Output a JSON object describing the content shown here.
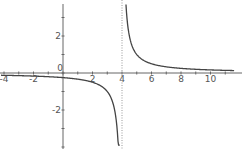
{
  "chart_data": {
    "type": "line",
    "title": "",
    "xlabel": "",
    "ylabel": "",
    "function": "y = 1/(x - 4)",
    "xlim": [
      -4.2,
      11.6
    ],
    "ylim": [
      -4.0,
      4.0
    ],
    "grid": false,
    "legend": null,
    "x_ticks": [
      "-4",
      "-2",
      "0",
      "2",
      "4",
      "6",
      "8",
      "10"
    ],
    "y_ticks": [
      "-2",
      "0",
      "2"
    ],
    "asymptote": {
      "x": 4,
      "style": "dotted"
    },
    "series": [
      {
        "name": "left branch",
        "x": [
          -4.2,
          -3,
          -2,
          -1,
          0,
          1,
          2,
          3,
          3.5,
          3.75,
          3.85
        ],
        "y": [
          -0.12,
          -0.14,
          -0.17,
          -0.2,
          -0.25,
          -0.33,
          -0.5,
          -1.0,
          -2.0,
          -4.0,
          -6.67
        ]
      },
      {
        "name": "right branch",
        "x": [
          4.27,
          4.5,
          5,
          6,
          7,
          8,
          9,
          10,
          11,
          11.6
        ],
        "y": [
          3.7,
          2.0,
          1.0,
          0.5,
          0.33,
          0.25,
          0.2,
          0.17,
          0.14,
          0.13
        ]
      }
    ],
    "colors": {
      "curve": "#444444",
      "axis": "#666666",
      "asymptote": "#999999"
    }
  }
}
